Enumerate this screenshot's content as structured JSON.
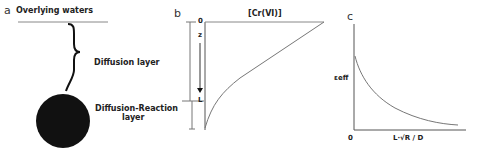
{
  "panels": {
    "a": {
      "letter": "a",
      "top_label": "Overlying waters",
      "middle_label": "Diffusion layer",
      "bottom_label_line1": "Diffusion-Reaction",
      "bottom_label_line2": "layer"
    },
    "b": {
      "letter": "b",
      "x_axis_title": "[Cr(VI)]",
      "tick_top": "0",
      "depth_var": "z",
      "tick_bottom": "L"
    },
    "c": {
      "letter": "c",
      "y_label": "εeff",
      "x_origin": "0",
      "x_label": "L·√R / D"
    }
  },
  "colors": {
    "lines": "#555555",
    "particle": "#111111",
    "text": "#222222"
  }
}
